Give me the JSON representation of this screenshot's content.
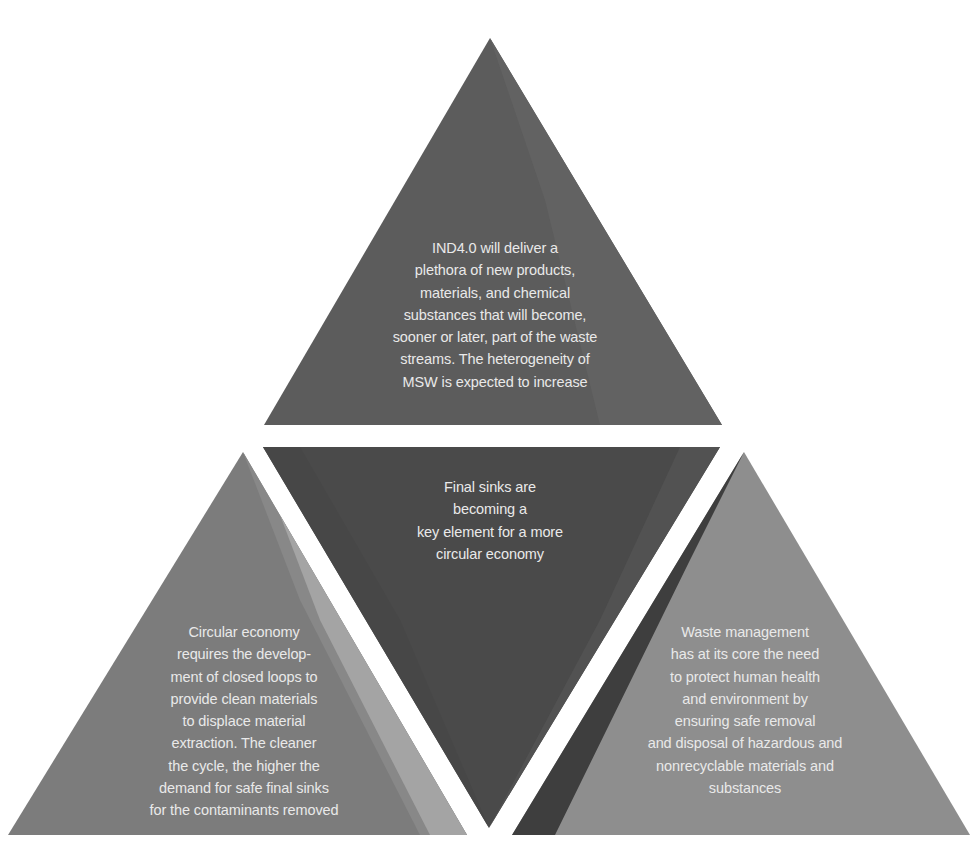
{
  "diagram": {
    "type": "triangle-of-triangles",
    "colors": {
      "background": "#ffffff",
      "top": "#5c5c5c",
      "top_facet": "#626262",
      "center": "#4a4a4a",
      "center_facet": "#525252",
      "left": "#7c7c7c",
      "left_facet_1": "#8f8f8f",
      "left_facet_2": "#a8a8a8",
      "right": "#8e8e8e",
      "right_facet": "#3e3e3e",
      "text": "#e9e9e9"
    },
    "top": {
      "text": "IND4.0 will deliver a\nplethora of new products,\nmaterials, and chemical\nsubstances that will become,\nsooner or later,  part of the waste\nstreams. The heterogeneity of\nMSW is expected to increase"
    },
    "center": {
      "text": "Final sinks are\nbecoming a\nkey element for a more\ncircular economy"
    },
    "left": {
      "text": "Circular economy\nrequires the develop-\nment of closed loops to\nprovide clean materials\nto displace material\nextraction. The cleaner\nthe cycle, the higher the\ndemand for safe final sinks\nfor the contaminants removed"
    },
    "right": {
      "text": "Waste management\nhas at its core the need\nto protect human health\nand environment by\nensuring safe removal\nand disposal of hazardous and\nnonrecyclable materials and\nsubstances"
    }
  }
}
